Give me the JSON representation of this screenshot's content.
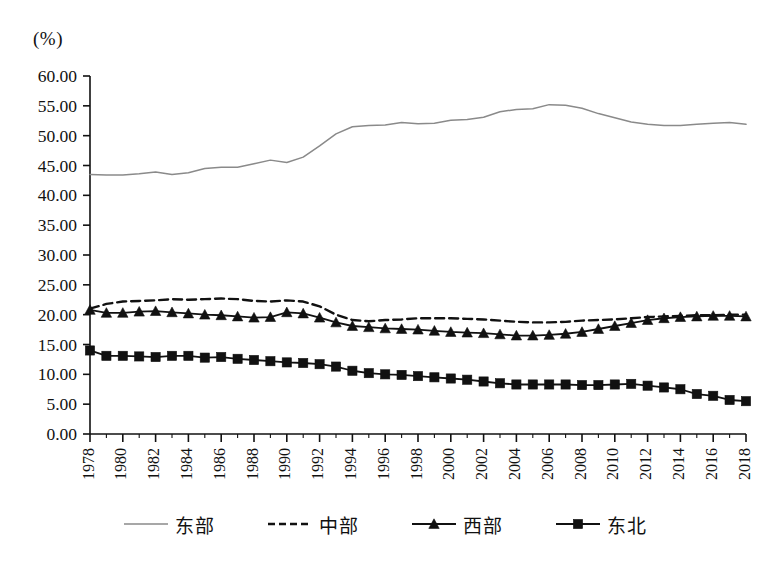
{
  "unit_label": "(%)",
  "axis": {
    "y_ticks": [
      "0.00",
      "5.00",
      "10.00",
      "15.00",
      "20.00",
      "25.00",
      "30.00",
      "35.00",
      "40.00",
      "45.00",
      "50.00",
      "55.00",
      "60.00"
    ],
    "x_ticks": [
      "1978",
      "1980",
      "1982",
      "1984",
      "1986",
      "1988",
      "1990",
      "1992",
      "1994",
      "1996",
      "1998",
      "2000",
      "2002",
      "2004",
      "2006",
      "2008",
      "2010",
      "2012",
      "2014",
      "2016",
      "2018"
    ]
  },
  "legend": [
    {
      "label": "东部",
      "style": "solid",
      "marker": "none",
      "color": "#8a8a8a"
    },
    {
      "label": "中部",
      "style": "dashed",
      "marker": "none",
      "color": "#111111"
    },
    {
      "label": "西部",
      "style": "solid",
      "marker": "triangle",
      "color": "#111111"
    },
    {
      "label": "东北",
      "style": "solid",
      "marker": "square",
      "color": "#111111"
    }
  ],
  "chart_data": {
    "type": "line",
    "title": "",
    "subtitle": "",
    "xlabel": "",
    "ylabel": "(%)",
    "xlim": [
      1978,
      2018
    ],
    "ylim": [
      0,
      60
    ],
    "ytick_step": 5,
    "xtick_step": 2,
    "grid": false,
    "legend_position": "bottom",
    "x": [
      1978,
      1979,
      1980,
      1981,
      1982,
      1983,
      1984,
      1985,
      1986,
      1987,
      1988,
      1989,
      1990,
      1991,
      1992,
      1993,
      1994,
      1995,
      1996,
      1997,
      1998,
      1999,
      2000,
      2001,
      2002,
      2003,
      2004,
      2005,
      2006,
      2007,
      2008,
      2009,
      2010,
      2011,
      2012,
      2013,
      2014,
      2015,
      2016,
      2017,
      2018
    ],
    "series": [
      {
        "name": "东部",
        "color": "#8a8a8a",
        "style": "solid",
        "marker": "none",
        "values": [
          43.5,
          43.4,
          43.4,
          43.6,
          43.9,
          43.5,
          43.8,
          44.5,
          44.7,
          44.7,
          45.3,
          45.9,
          45.5,
          46.4,
          48.3,
          50.3,
          51.5,
          51.7,
          51.8,
          52.2,
          52.0,
          52.1,
          52.6,
          52.7,
          53.1,
          54.0,
          54.4,
          54.5,
          55.2,
          55.1,
          54.6,
          53.7,
          53.0,
          52.3,
          51.9,
          51.7,
          51.7,
          51.9,
          52.1,
          52.2,
          51.9
        ]
      },
      {
        "name": "中部",
        "color": "#111111",
        "style": "dashed",
        "marker": "none",
        "values": [
          21.0,
          21.8,
          22.2,
          22.3,
          22.4,
          22.6,
          22.5,
          22.6,
          22.7,
          22.6,
          22.3,
          22.2,
          22.4,
          22.2,
          21.4,
          20.0,
          19.1,
          18.9,
          19.1,
          19.2,
          19.4,
          19.4,
          19.4,
          19.3,
          19.2,
          19.0,
          18.8,
          18.7,
          18.7,
          18.8,
          19.0,
          19.1,
          19.2,
          19.4,
          19.6,
          19.7,
          19.8,
          19.9,
          19.9,
          20.0,
          20.0
        ]
      },
      {
        "name": "西部",
        "color": "#111111",
        "style": "solid",
        "marker": "triangle",
        "values": [
          20.8,
          20.3,
          20.3,
          20.5,
          20.6,
          20.4,
          20.2,
          20.0,
          19.9,
          19.7,
          19.5,
          19.6,
          20.4,
          20.2,
          19.5,
          18.7,
          18.1,
          17.9,
          17.7,
          17.6,
          17.5,
          17.3,
          17.1,
          17.0,
          16.9,
          16.7,
          16.5,
          16.5,
          16.6,
          16.8,
          17.1,
          17.6,
          18.1,
          18.6,
          19.1,
          19.4,
          19.6,
          19.7,
          19.8,
          19.8,
          19.7
        ]
      },
      {
        "name": "东北",
        "color": "#111111",
        "style": "solid",
        "marker": "square",
        "values": [
          14.0,
          13.1,
          13.1,
          13.0,
          12.9,
          13.1,
          13.1,
          12.8,
          12.9,
          12.6,
          12.4,
          12.2,
          12.0,
          11.9,
          11.7,
          11.3,
          10.6,
          10.2,
          10.0,
          9.9,
          9.7,
          9.5,
          9.3,
          9.1,
          8.8,
          8.5,
          8.3,
          8.3,
          8.3,
          8.3,
          8.2,
          8.2,
          8.3,
          8.4,
          8.1,
          7.8,
          7.5,
          6.7,
          6.4,
          5.7,
          5.5
        ]
      }
    ]
  }
}
